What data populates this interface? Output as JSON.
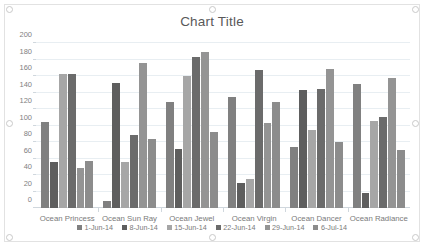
{
  "chart_data": {
    "type": "bar",
    "title": "Chart Title",
    "xlabel": "",
    "ylabel": "",
    "ylim": [
      0,
      200
    ],
    "yticks": [
      0,
      20,
      40,
      60,
      80,
      100,
      120,
      140,
      160,
      180,
      200
    ],
    "grid": true,
    "legend_position": "bottom",
    "categories": [
      "Ocean Princess",
      "Ocean Sun Ray",
      "Ocean Jewel",
      "Ocean Virgin",
      "Ocean Dancer",
      "Ocean Radiance"
    ],
    "series": [
      {
        "name": "1-Jun-14",
        "color": "#808080",
        "values": [
          104,
          9,
          128,
          134,
          74,
          150
        ]
      },
      {
        "name": "8-Jun-14",
        "color": "#5e5e5e",
        "values": [
          56,
          152,
          72,
          30,
          143,
          18
        ]
      },
      {
        "name": "15-Jun-14",
        "color": "#a6a6a6",
        "values": [
          163,
          56,
          160,
          35,
          95,
          105
        ]
      },
      {
        "name": "22-Jun-14",
        "color": "#6b6b6b",
        "values": [
          163,
          88,
          183,
          167,
          144,
          110
        ]
      },
      {
        "name": "29-Jun-14",
        "color": "#949494",
        "values": [
          49,
          176,
          189,
          103,
          168,
          157
        ]
      },
      {
        "name": "6-Jul-14",
        "color": "#8c8c8c",
        "values": [
          57,
          84,
          92,
          128,
          80,
          70
        ]
      }
    ]
  },
  "colors": {
    "title_text": "#595959",
    "axis_text": "#7f7f7f",
    "gridline": "#e8eef2",
    "chart_border": "#e2e2e2",
    "plot_background": "#ffffff"
  }
}
